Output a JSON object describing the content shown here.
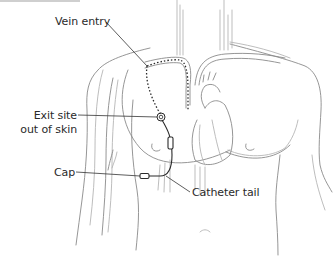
{
  "diagram": {
    "labels": {
      "vein_entry": "Vein entry",
      "exit_site_line1": "Exit site",
      "exit_site_line2": "out of skin",
      "cap": "Cap",
      "catheter_tail": "Catheter tail"
    },
    "colors": {
      "outline": "#8a8a8a",
      "outline_light": "#b5b5b5",
      "leader": "#333333",
      "catheter": "#2a2a2a",
      "text": "#2a2a2a",
      "background": "#ffffff"
    }
  }
}
